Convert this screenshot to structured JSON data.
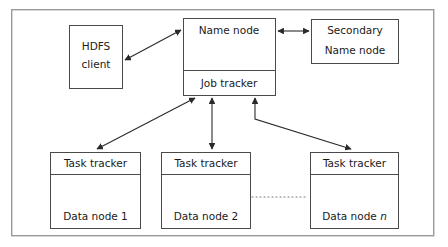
{
  "diagram": {
    "type": "block-diagram",
    "frame": {
      "x": 11,
      "y": 9,
      "width": 423,
      "height": 227
    },
    "nodes": [
      {
        "id": "hdfs-client",
        "label_line1": "HDFS",
        "label_line2": "client",
        "x": 69,
        "y": 25,
        "width": 53,
        "height": 63,
        "sections": 1
      },
      {
        "id": "name-node",
        "label": "Name node",
        "x": 183,
        "y": 18,
        "width": 92,
        "height": 52,
        "sections": 1
      },
      {
        "id": "job-tracker",
        "label": "Job tracker",
        "x": 183,
        "y": 70,
        "width": 92,
        "height": 25,
        "sections": 1
      },
      {
        "id": "secondary-name-node",
        "label_line1": "Secondary",
        "label_line2": "Name node",
        "x": 311,
        "y": 19,
        "width": 87,
        "height": 44,
        "sections": 1
      },
      {
        "id": "task-tracker-1",
        "header": "Task tracker",
        "footer": "Data node 1",
        "x": 50,
        "y": 152,
        "width": 90,
        "height": 76,
        "divider_offset": 22
      },
      {
        "id": "task-tracker-2",
        "header": "Task tracker",
        "footer": "Data node 2",
        "x": 161,
        "y": 152,
        "width": 89,
        "height": 76,
        "divider_offset": 22
      },
      {
        "id": "task-tracker-n",
        "header": "Task tracker",
        "footer_prefix": "Data node ",
        "footer_italic": "n",
        "x": 310,
        "y": 152,
        "width": 88,
        "height": 76,
        "divider_offset": 22
      }
    ],
    "connectors": [
      {
        "id": "hdfs-client-to-name-node",
        "from": "hdfs-client",
        "to": "name-node",
        "arrowheads": "both",
        "path": "M 124 61 L 181 30"
      },
      {
        "id": "name-node-to-secondary-name-node",
        "from": "name-node",
        "to": "secondary-name-node",
        "arrowheads": "both",
        "path": "M 277 31 L 309 31"
      },
      {
        "id": "job-tracker-to-task-tracker-1",
        "from": "job-tracker",
        "to": "task-tracker-1",
        "arrowheads": "both",
        "path": "M 196 97 L 96 150"
      },
      {
        "id": "job-tracker-to-task-tracker-2",
        "from": "job-tracker",
        "to": "task-tracker-2",
        "arrowheads": "both",
        "path": "M 212 97 L 212 150"
      },
      {
        "id": "job-tracker-to-task-tracker-n",
        "from": "job-tracker",
        "to": "task-tracker-n",
        "arrowheads": "both",
        "path": "M 255 97 L 255 119 L 352 150"
      }
    ],
    "ellipsis": {
      "id": "node-continuation-dots",
      "x1": 252,
      "y1": 197,
      "x2": 308,
      "y2": 197
    },
    "colors": {
      "background": "#ffffff",
      "box_stroke": "#4a4a4a",
      "frame_stroke": "#9a9a9a",
      "connector_stroke": "#2a2a2a",
      "text": "#1a1a1a",
      "dots": "#7a7a7a"
    }
  }
}
